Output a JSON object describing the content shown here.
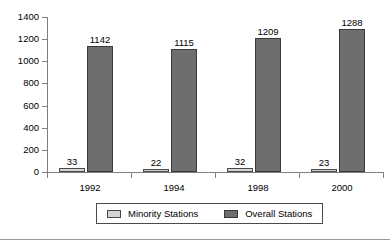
{
  "chart_data": {
    "type": "bar",
    "title": "",
    "subtitle": "",
    "xlabel": "",
    "ylabel": "",
    "categories": [
      "1992",
      "1994",
      "1998",
      "2000"
    ],
    "series": [
      {
        "name": "Minority Stations",
        "color": "#d4d4d4",
        "values": [
          33,
          22,
          32,
          23
        ]
      },
      {
        "name": "Overall Stations",
        "color": "#6e6e6e",
        "values": [
          1142,
          1115,
          1209,
          1288
        ]
      }
    ],
    "ylim": [
      0,
      1400
    ],
    "ytick_step": 200,
    "yticks": [
      "0",
      "200",
      "400",
      "600",
      "800",
      "1000",
      "1200",
      "1400"
    ],
    "grid": false,
    "data_labels": true,
    "legend_position": "bottom"
  },
  "legend": {
    "items": [
      {
        "label": "Minority Stations",
        "swatch": "minority"
      },
      {
        "label": "Overall Stations",
        "swatch": "overall"
      }
    ]
  }
}
